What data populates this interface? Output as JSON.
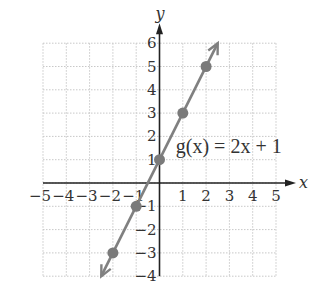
{
  "chart_data": {
    "type": "line",
    "title": "",
    "xlabel": "x",
    "ylabel": "y",
    "xlim": [
      -5,
      5
    ],
    "ylim": [
      -4,
      6
    ],
    "grid": true,
    "x_ticks": [
      "−5",
      "−4",
      "−3",
      "−2",
      "−1",
      "1",
      "2",
      "3",
      "4",
      "5"
    ],
    "y_ticks": [
      "6",
      "5",
      "4",
      "3",
      "2",
      "1",
      "−1",
      "−2",
      "−3",
      "−4"
    ],
    "series": [
      {
        "name": "g(x) = 2x + 1",
        "equation": "g(x) = 2x + 1",
        "slope": 2,
        "intercept": 1,
        "color": "#808080",
        "points": [
          {
            "x": -2,
            "y": -3
          },
          {
            "x": -1,
            "y": -1
          },
          {
            "x": 0,
            "y": 1
          },
          {
            "x": 1,
            "y": 3
          },
          {
            "x": 2,
            "y": 5
          }
        ],
        "line_extent": {
          "x_start": -2.5,
          "x_end": 2.5
        }
      }
    ],
    "annotations": [
      {
        "text": "g(x) = 2x + 1",
        "x": 0.7,
        "y": 1.5
      }
    ]
  },
  "labels": {
    "x_axis": "x",
    "y_axis": "y",
    "equation": "g(x) = 2x + 1"
  },
  "colors": {
    "axis": "#222222",
    "grid": "#c8c8c8",
    "line": "#808080",
    "point": "#7a7a7a",
    "text": "#333333"
  }
}
